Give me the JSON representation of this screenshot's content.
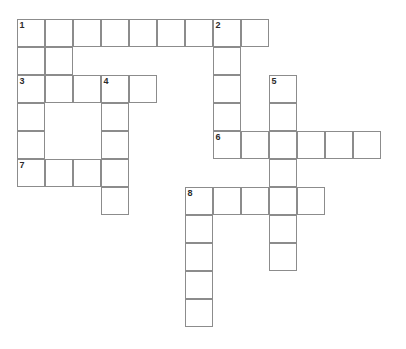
{
  "puzzle": {
    "title": "Crossword Grid",
    "grid": {
      "origin_x": 17,
      "origin_y": 19,
      "cell_size": 28,
      "columns": 13,
      "rows": 11,
      "line_color": "#8c8c8c",
      "cell_fill": "#ffffff",
      "background": "#ffffff",
      "number_color": "#2b2b2b"
    },
    "cells": [
      {
        "row": 0,
        "col": 0,
        "number": "1",
        "letter": ""
      },
      {
        "row": 0,
        "col": 1,
        "number": "",
        "letter": ""
      },
      {
        "row": 0,
        "col": 2,
        "number": "",
        "letter": ""
      },
      {
        "row": 0,
        "col": 3,
        "number": "",
        "letter": ""
      },
      {
        "row": 0,
        "col": 4,
        "number": "",
        "letter": ""
      },
      {
        "row": 0,
        "col": 5,
        "number": "",
        "letter": ""
      },
      {
        "row": 0,
        "col": 6,
        "number": "",
        "letter": ""
      },
      {
        "row": 0,
        "col": 7,
        "number": "2",
        "letter": ""
      },
      {
        "row": 0,
        "col": 8,
        "number": "",
        "letter": ""
      },
      {
        "row": 1,
        "col": 0,
        "number": "",
        "letter": ""
      },
      {
        "row": 1,
        "col": 1,
        "number": "",
        "letter": ""
      },
      {
        "row": 1,
        "col": 7,
        "number": "",
        "letter": ""
      },
      {
        "row": 2,
        "col": 0,
        "number": "3",
        "letter": ""
      },
      {
        "row": 2,
        "col": 1,
        "number": "",
        "letter": ""
      },
      {
        "row": 2,
        "col": 2,
        "number": "",
        "letter": ""
      },
      {
        "row": 2,
        "col": 3,
        "number": "4",
        "letter": ""
      },
      {
        "row": 2,
        "col": 4,
        "number": "",
        "letter": ""
      },
      {
        "row": 2,
        "col": 7,
        "number": "",
        "letter": ""
      },
      {
        "row": 2,
        "col": 9,
        "number": "5",
        "letter": ""
      },
      {
        "row": 3,
        "col": 0,
        "number": "",
        "letter": ""
      },
      {
        "row": 3,
        "col": 3,
        "number": "",
        "letter": ""
      },
      {
        "row": 3,
        "col": 7,
        "number": "",
        "letter": ""
      },
      {
        "row": 3,
        "col": 9,
        "number": "",
        "letter": ""
      },
      {
        "row": 4,
        "col": 0,
        "number": "",
        "letter": ""
      },
      {
        "row": 4,
        "col": 3,
        "number": "",
        "letter": ""
      },
      {
        "row": 4,
        "col": 7,
        "number": "6",
        "letter": ""
      },
      {
        "row": 4,
        "col": 8,
        "number": "",
        "letter": ""
      },
      {
        "row": 4,
        "col": 9,
        "number": "",
        "letter": ""
      },
      {
        "row": 4,
        "col": 10,
        "number": "",
        "letter": ""
      },
      {
        "row": 4,
        "col": 11,
        "number": "",
        "letter": ""
      },
      {
        "row": 4,
        "col": 12,
        "number": "",
        "letter": ""
      },
      {
        "row": 5,
        "col": 0,
        "number": "7",
        "letter": ""
      },
      {
        "row": 5,
        "col": 1,
        "number": "",
        "letter": ""
      },
      {
        "row": 5,
        "col": 2,
        "number": "",
        "letter": ""
      },
      {
        "row": 5,
        "col": 3,
        "number": "",
        "letter": ""
      },
      {
        "row": 5,
        "col": 9,
        "number": "",
        "letter": ""
      },
      {
        "row": 6,
        "col": 3,
        "number": "",
        "letter": ""
      },
      {
        "row": 6,
        "col": 6,
        "number": "8",
        "letter": ""
      },
      {
        "row": 6,
        "col": 7,
        "number": "",
        "letter": ""
      },
      {
        "row": 6,
        "col": 8,
        "number": "",
        "letter": ""
      },
      {
        "row": 6,
        "col": 9,
        "number": "",
        "letter": ""
      },
      {
        "row": 6,
        "col": 10,
        "number": "",
        "letter": ""
      },
      {
        "row": 7,
        "col": 6,
        "number": "",
        "letter": ""
      },
      {
        "row": 7,
        "col": 9,
        "number": "",
        "letter": ""
      },
      {
        "row": 8,
        "col": 6,
        "number": "",
        "letter": ""
      },
      {
        "row": 8,
        "col": 9,
        "number": "",
        "letter": ""
      },
      {
        "row": 9,
        "col": 6,
        "number": "",
        "letter": ""
      },
      {
        "row": 10,
        "col": 6,
        "number": "",
        "letter": ""
      }
    ]
  }
}
